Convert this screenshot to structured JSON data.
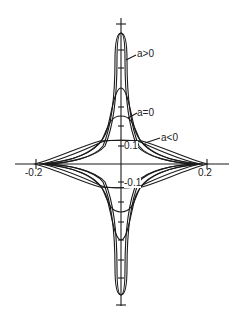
{
  "diagram": {
    "type": "astroid-like curve family",
    "axes": {
      "x_ticks": [
        {
          "value": -0.2,
          "label": "-0.2"
        },
        {
          "value": 0.2,
          "label": "0.2"
        }
      ],
      "y_ticks": [
        {
          "value": 0.1,
          "label": "0.1"
        },
        {
          "value": -0.1,
          "label": "-0.1"
        }
      ]
    },
    "curve_labels": [
      {
        "id": "a_pos",
        "label": "a>0"
      },
      {
        "id": "a_zero",
        "label": "a=0"
      },
      {
        "id": "a_neg",
        "label": "a<0"
      }
    ],
    "colors": {
      "line": "#1a1a1a",
      "background": "#ffffff"
    }
  }
}
